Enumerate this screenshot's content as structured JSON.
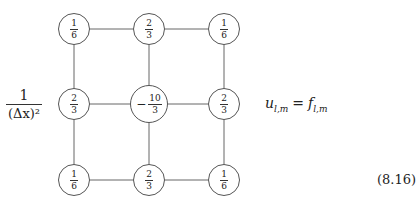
{
  "stencil": {
    "coefficient": {
      "numerator": "1",
      "denominator": "(Δx)²"
    },
    "grid": [
      [
        {
          "sign": "",
          "num": "1",
          "den": "6"
        },
        {
          "sign": "",
          "num": "2",
          "den": "3"
        },
        {
          "sign": "",
          "num": "1",
          "den": "6"
        }
      ],
      [
        {
          "sign": "",
          "num": "2",
          "den": "3"
        },
        {
          "sign": "−",
          "num": "10",
          "den": "3"
        },
        {
          "sign": "",
          "num": "2",
          "den": "3"
        }
      ],
      [
        {
          "sign": "",
          "num": "1",
          "den": "6"
        },
        {
          "sign": "",
          "num": "2",
          "den": "3"
        },
        {
          "sign": "",
          "num": "1",
          "den": "6"
        }
      ]
    ],
    "equation": {
      "lhs": "u",
      "lhs_sub": "l,m",
      "op": "=",
      "rhs": "f",
      "rhs_sub": "l,m"
    },
    "equation_number": "(8.16)"
  }
}
